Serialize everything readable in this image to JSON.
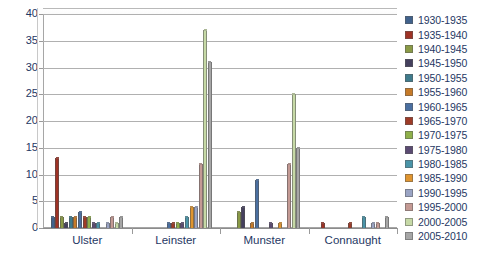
{
  "chart_data": {
    "type": "bar",
    "title": "",
    "xlabel": "",
    "ylabel": "",
    "ylim": [
      0,
      40
    ],
    "ytick_step": 5,
    "yticks": [
      40,
      35,
      30,
      25,
      20,
      15,
      10,
      5,
      0
    ],
    "grid": true,
    "legend_position": "right",
    "categories": [
      "Ulster",
      "Leinster",
      "Munster",
      "Connaught"
    ],
    "series": [
      {
        "name": "1930-1935",
        "color": "#41628c",
        "values": [
          2,
          0,
          0,
          0
        ]
      },
      {
        "name": "1935-1940",
        "color": "#9e3225",
        "values": [
          13,
          0,
          0,
          1
        ]
      },
      {
        "name": "1940-1945",
        "color": "#8a9a46",
        "values": [
          2,
          0,
          3,
          0
        ]
      },
      {
        "name": "1945-1950",
        "color": "#45405e",
        "values": [
          1,
          0,
          4,
          0
        ]
      },
      {
        "name": "1950-1955",
        "color": "#3f7b8c",
        "values": [
          2,
          0,
          0,
          0
        ]
      },
      {
        "name": "1955-1960",
        "color": "#c67a28",
        "values": [
          2,
          0,
          1,
          0
        ]
      },
      {
        "name": "1960-1965",
        "color": "#4a6fa0",
        "values": [
          3,
          1,
          9,
          0
        ]
      },
      {
        "name": "1965-1970",
        "color": "#9e3b27",
        "values": [
          2,
          1,
          0,
          1
        ]
      },
      {
        "name": "1970-1975",
        "color": "#8fb04a",
        "values": [
          2,
          1,
          0,
          0
        ]
      },
      {
        "name": "1975-1980",
        "color": "#5b4b72",
        "values": [
          1,
          1,
          1,
          0
        ]
      },
      {
        "name": "1980-1985",
        "color": "#4a94a8",
        "values": [
          1,
          2,
          0,
          2
        ]
      },
      {
        "name": "1985-1990",
        "color": "#e0952f",
        "values": [
          0,
          4,
          1,
          0
        ]
      },
      {
        "name": "1990-1995",
        "color": "#9aa4c4",
        "values": [
          1,
          4,
          0,
          1
        ]
      },
      {
        "name": "1995-2000",
        "color": "#c49a94",
        "values": [
          2,
          12,
          12,
          1
        ]
      },
      {
        "name": "2000-2005",
        "color": "#c6d9a6",
        "values": [
          1,
          37,
          25,
          0
        ]
      },
      {
        "name": "2005-2010",
        "color": "#a6a6a6",
        "values": [
          2,
          31,
          15,
          2
        ]
      }
    ]
  },
  "axis": {
    "y_tick_color": "#1f3864",
    "x_tick_color": "#1f3864"
  }
}
